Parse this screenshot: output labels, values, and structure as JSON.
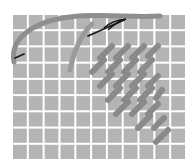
{
  "illustration": {
    "subject": "needlepoint canvas with thread and needle",
    "canvas": {
      "x": 12,
      "y": 14,
      "width": 174,
      "height": 146,
      "columns": 11,
      "rows": 9,
      "cell_color": "#b4b4b4",
      "grid_line_color": "#ffffff"
    },
    "thread_color": "#8e8e8e",
    "stitch_color": "#8a8a8a",
    "needle_color": "#1a1a1a"
  }
}
